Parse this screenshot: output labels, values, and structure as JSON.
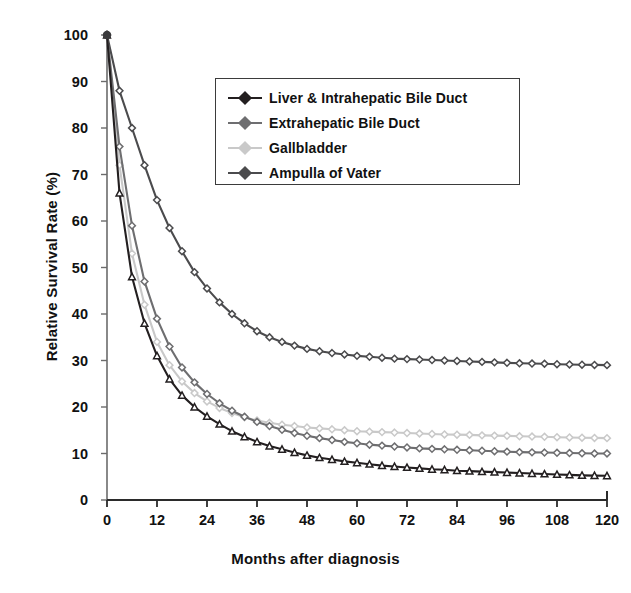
{
  "chart_data": {
    "type": "line",
    "title": "",
    "xlabel": "Months after diagnosis",
    "ylabel": "Relative Survival Rate (%)",
    "xlim": [
      0,
      120
    ],
    "ylim": [
      0,
      100
    ],
    "xticks": [
      0,
      12,
      24,
      36,
      48,
      60,
      72,
      84,
      96,
      108,
      120
    ],
    "yticks": [
      0,
      10,
      20,
      30,
      40,
      50,
      60,
      70,
      80,
      90,
      100
    ],
    "xtick_labels": [
      "0",
      "12",
      "24",
      "36",
      "48",
      "60",
      "72",
      "84",
      "96",
      "108",
      "120"
    ],
    "ytick_labels": [
      "0",
      "10",
      "20",
      "30",
      "40",
      "50",
      "60",
      "70",
      "80",
      "90",
      "100"
    ],
    "grid": false,
    "legend_position": "upper center-right",
    "marker_interval_months": 3,
    "x": [
      0,
      3,
      6,
      9,
      12,
      15,
      18,
      21,
      24,
      27,
      30,
      33,
      36,
      39,
      42,
      45,
      48,
      51,
      54,
      57,
      60,
      63,
      66,
      69,
      72,
      75,
      78,
      81,
      84,
      87,
      90,
      93,
      96,
      99,
      102,
      105,
      108,
      111,
      114,
      117,
      120
    ],
    "series": [
      {
        "name": "Liver & Intrahepatic Bile Duct",
        "color": "#231f20",
        "marker": "triangle",
        "values": [
          100,
          66,
          48,
          38,
          31,
          26,
          22.5,
          20,
          18,
          16.3,
          14.8,
          13.6,
          12.5,
          11.6,
          10.9,
          10.2,
          9.6,
          9.1,
          8.7,
          8.3,
          8.0,
          7.7,
          7.4,
          7.2,
          7.0,
          6.8,
          6.6,
          6.5,
          6.3,
          6.2,
          6.1,
          6.0,
          5.9,
          5.8,
          5.7,
          5.6,
          5.5,
          5.4,
          5.3,
          5.25,
          5.2
        ]
      },
      {
        "name": "Extrahepatic Bile Duct",
        "color": "#6e6e70",
        "marker": "diamond",
        "values": [
          100,
          76,
          59,
          47,
          39,
          33,
          28.5,
          25.3,
          22.8,
          20.8,
          19.2,
          17.9,
          16.8,
          15.9,
          15.1,
          14.4,
          13.8,
          13.3,
          12.9,
          12.5,
          12.2,
          11.9,
          11.7,
          11.5,
          11.3,
          11.1,
          11.0,
          10.9,
          10.8,
          10.7,
          10.6,
          10.5,
          10.4,
          10.3,
          10.25,
          10.2,
          10.15,
          10.1,
          10.05,
          10.0,
          10.0
        ]
      },
      {
        "name": "Gallbladder",
        "color": "#c9c9c9",
        "marker": "diamond",
        "values": [
          100,
          72,
          53,
          42,
          34,
          29,
          25.5,
          23.0,
          21.2,
          19.8,
          18.7,
          17.8,
          17.1,
          16.6,
          16.2,
          15.9,
          15.6,
          15.4,
          15.2,
          15.0,
          14.8,
          14.7,
          14.6,
          14.5,
          14.4,
          14.3,
          14.2,
          14.1,
          14.05,
          14.0,
          13.9,
          13.85,
          13.8,
          13.7,
          13.65,
          13.6,
          13.5,
          13.45,
          13.4,
          13.35,
          13.3
        ]
      },
      {
        "name": "Ampulla of Vater",
        "color": "#4b4b4d",
        "marker": "diamond",
        "values": [
          100,
          88,
          80,
          72,
          64.5,
          58.5,
          53.5,
          49.0,
          45.5,
          42.5,
          40.0,
          38.0,
          36.3,
          35.0,
          34.0,
          33.2,
          32.5,
          32.0,
          31.6,
          31.3,
          31.0,
          30.8,
          30.6,
          30.4,
          30.3,
          30.2,
          30.1,
          30.0,
          29.9,
          29.8,
          29.7,
          29.6,
          29.5,
          29.4,
          29.35,
          29.3,
          29.2,
          29.15,
          29.1,
          29.05,
          29.0
        ]
      }
    ]
  },
  "legend": {
    "items": [
      {
        "label": "Liver & Intrahepatic Bile Duct",
        "color": "#231f20"
      },
      {
        "label": "Extrahepatic Bile Duct",
        "color": "#6e6e70"
      },
      {
        "label": "Gallbladder",
        "color": "#c9c9c9"
      },
      {
        "label": "Ampulla of Vater",
        "color": "#4b4b4d"
      }
    ]
  },
  "axes": {
    "x_title": "Months after diagnosis",
    "y_title": "Relative Survival Rate (%)"
  }
}
